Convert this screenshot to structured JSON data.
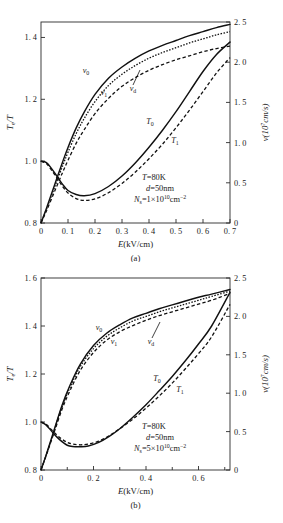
{
  "figure": {
    "panels": [
      {
        "id": "a",
        "caption": "(a)",
        "xlabel": "E(kV/cm)",
        "ylabel_left": "T",
        "ylabel_left_sub": "e",
        "ylabel_left_tail": "/T",
        "ylabel_right": "v(10",
        "ylabel_right_sup": "7",
        "ylabel_right_tail": "cm/s)",
        "annotations": [
          {
            "label": "T",
            "eq": "=80K"
          },
          {
            "label": "d",
            "eq": "=50nm"
          },
          {
            "label": "N",
            "sub": "s",
            "eq": "=1×10",
            "sup": "10",
            "tail": "cm",
            "tailsup": "−2"
          }
        ],
        "curve_labels": [
          {
            "name": "v0",
            "text": "v",
            "sub": "0"
          },
          {
            "name": "v1",
            "text": "v",
            "sub": "1"
          },
          {
            "name": "vd",
            "text": "v",
            "sub": "d"
          },
          {
            "name": "T0",
            "text": "T",
            "sub": "0"
          },
          {
            "name": "T1",
            "text": "T",
            "sub": "1"
          }
        ]
      },
      {
        "id": "b",
        "caption": "(b)",
        "xlabel": "E(kV/cm)",
        "ylabel_left": "T",
        "ylabel_left_sub": "e",
        "ylabel_left_tail": "/T",
        "ylabel_right": "v(10",
        "ylabel_right_sup": "7",
        "ylabel_right_tail": "cm/s)",
        "annotations": [
          {
            "label": "T",
            "eq": "=80K"
          },
          {
            "label": "d",
            "eq": "=50nm"
          },
          {
            "label": "N",
            "sub": "s",
            "eq": "=5×10",
            "sup": "10",
            "tail": "cm",
            "tailsup": "−2"
          }
        ],
        "curve_labels": [
          {
            "name": "v0",
            "text": "v",
            "sub": "0"
          },
          {
            "name": "v1",
            "text": "v",
            "sub": "1"
          },
          {
            "name": "vd",
            "text": "v",
            "sub": "d"
          },
          {
            "name": "T0",
            "text": "T",
            "sub": "0"
          },
          {
            "name": "T1",
            "text": "T",
            "sub": "1"
          }
        ]
      }
    ]
  },
  "chart_data": [
    {
      "type": "line",
      "panel": "a",
      "title": "",
      "xlabel": "E(kV/cm)",
      "ylabel": "Te/T",
      "ylabel_right": "v(10^7 cm/s)",
      "xlim": [
        0,
        0.7
      ],
      "ylim_left": [
        0.8,
        1.45
      ],
      "ylim_right": [
        0,
        2.5
      ],
      "xticks": [
        0,
        0.1,
        0.2,
        0.3,
        0.4,
        0.5,
        0.6,
        0.7
      ],
      "xticklabels": [
        "0",
        "0. 1",
        "0. 2",
        "0. 3",
        "0. 4",
        "0. 5",
        "0. 6",
        "0. 7"
      ],
      "yticks_left": [
        0.8,
        1.0,
        1.2,
        1.4
      ],
      "yticklabels_left": [
        "0. 8",
        "1. 0",
        "1. 2",
        "1. 4"
      ],
      "yticks_right": [
        0,
        0.5,
        1.0,
        1.5,
        2.0,
        2.5
      ],
      "yticklabels_right": [
        "0",
        "0. 5",
        "1. 0",
        "1. 5",
        "2. 0",
        "2. 5"
      ],
      "grid": false,
      "legend": "inline-labels",
      "annotation_text": [
        "T=80K",
        "d=50nm",
        "Ns=1×10^10 cm^-2"
      ],
      "series": [
        {
          "name": "v0",
          "axis": "right",
          "style": "solid",
          "x": [
            0,
            0.02,
            0.05,
            0.08,
            0.1,
            0.13,
            0.16,
            0.2,
            0.25,
            0.3,
            0.35,
            0.4,
            0.45,
            0.5,
            0.55,
            0.6,
            0.65,
            0.7
          ],
          "y": [
            0,
            0.18,
            0.47,
            0.76,
            0.94,
            1.18,
            1.38,
            1.6,
            1.8,
            1.94,
            2.05,
            2.14,
            2.21,
            2.27,
            2.33,
            2.38,
            2.43,
            2.47
          ]
        },
        {
          "name": "vd",
          "axis": "right",
          "style": "dotted",
          "x": [
            0,
            0.02,
            0.05,
            0.08,
            0.1,
            0.13,
            0.16,
            0.2,
            0.25,
            0.3,
            0.35,
            0.4,
            0.45,
            0.5,
            0.55,
            0.6,
            0.65,
            0.7
          ],
          "y": [
            0,
            0.17,
            0.44,
            0.71,
            0.88,
            1.11,
            1.3,
            1.51,
            1.71,
            1.85,
            1.96,
            2.05,
            2.12,
            2.18,
            2.24,
            2.29,
            2.34,
            2.38
          ]
        },
        {
          "name": "v1",
          "axis": "right",
          "style": "dashed",
          "x": [
            0,
            0.02,
            0.05,
            0.08,
            0.1,
            0.13,
            0.16,
            0.2,
            0.25,
            0.3,
            0.35,
            0.4,
            0.45,
            0.5,
            0.55,
            0.6,
            0.65,
            0.7
          ],
          "y": [
            0,
            0.15,
            0.39,
            0.63,
            0.78,
            0.99,
            1.16,
            1.36,
            1.55,
            1.7,
            1.81,
            1.9,
            1.97,
            2.03,
            2.08,
            2.13,
            2.17,
            2.2
          ]
        },
        {
          "name": "T0",
          "axis": "left",
          "style": "solid",
          "x": [
            0,
            0.02,
            0.04,
            0.06,
            0.08,
            0.1,
            0.13,
            0.16,
            0.2,
            0.25,
            0.3,
            0.35,
            0.4,
            0.45,
            0.5,
            0.55,
            0.6,
            0.65,
            0.7
          ],
          "y": [
            1.0,
            0.995,
            0.975,
            0.95,
            0.925,
            0.905,
            0.892,
            0.888,
            0.895,
            0.918,
            0.952,
            0.995,
            1.045,
            1.1,
            1.16,
            1.225,
            1.29,
            1.345,
            1.385
          ]
        },
        {
          "name": "T1",
          "axis": "left",
          "style": "dashed",
          "x": [
            0,
            0.02,
            0.04,
            0.06,
            0.08,
            0.1,
            0.13,
            0.16,
            0.2,
            0.25,
            0.3,
            0.35,
            0.4,
            0.45,
            0.5,
            0.55,
            0.6,
            0.65,
            0.7
          ],
          "y": [
            1.0,
            0.992,
            0.97,
            0.944,
            0.918,
            0.897,
            0.879,
            0.873,
            0.878,
            0.898,
            0.928,
            0.965,
            1.008,
            1.055,
            1.108,
            1.165,
            1.225,
            1.285,
            1.335
          ]
        }
      ]
    },
    {
      "type": "line",
      "panel": "b",
      "title": "",
      "xlabel": "E(kV/cm)",
      "ylabel": "Te/T",
      "ylabel_right": "v(10^7 cm/s)",
      "xlim": [
        0,
        0.72
      ],
      "ylim_left": [
        0.8,
        1.6
      ],
      "ylim_right": [
        0,
        2.5
      ],
      "xticks": [
        0,
        0.2,
        0.4,
        0.6
      ],
      "xticklabels": [
        "0",
        "0. 2",
        "0. 4",
        "0. 6"
      ],
      "xticks_minor": [
        0.1,
        0.3,
        0.5,
        0.7
      ],
      "yticks_left": [
        0.8,
        1.0,
        1.2,
        1.4,
        1.6
      ],
      "yticklabels_left": [
        "0. 8",
        "1. 0",
        "1. 2",
        "1. 4",
        "1. 6"
      ],
      "yticks_right": [
        0,
        0.5,
        1.0,
        1.5,
        2.0,
        2.5
      ],
      "yticklabels_right": [
        "0",
        "0. 5",
        "1. 0",
        "1. 5",
        "2. 0",
        "2. 5"
      ],
      "grid": false,
      "legend": "inline-labels",
      "annotation_text": [
        "T=80K",
        "d=50nm",
        "Ns=5×10^10 cm^-2"
      ],
      "series": [
        {
          "name": "v0",
          "axis": "right",
          "style": "solid",
          "x": [
            0,
            0.02,
            0.05,
            0.08,
            0.11,
            0.15,
            0.2,
            0.25,
            0.3,
            0.35,
            0.4,
            0.45,
            0.5,
            0.55,
            0.6,
            0.65,
            0.72
          ],
          "y": [
            0,
            0.2,
            0.52,
            0.84,
            1.1,
            1.38,
            1.62,
            1.78,
            1.89,
            1.98,
            2.04,
            2.1,
            2.15,
            2.2,
            2.25,
            2.29,
            2.35
          ]
        },
        {
          "name": "vd",
          "axis": "right",
          "style": "dotted",
          "x": [
            0,
            0.02,
            0.05,
            0.08,
            0.11,
            0.15,
            0.2,
            0.25,
            0.3,
            0.35,
            0.4,
            0.45,
            0.5,
            0.55,
            0.6,
            0.65,
            0.72
          ],
          "y": [
            0,
            0.195,
            0.51,
            0.82,
            1.07,
            1.35,
            1.58,
            1.74,
            1.85,
            1.94,
            2.0,
            2.06,
            2.11,
            2.16,
            2.21,
            2.26,
            2.33
          ]
        },
        {
          "name": "v1",
          "axis": "right",
          "style": "dashed",
          "x": [
            0,
            0.02,
            0.05,
            0.08,
            0.11,
            0.15,
            0.2,
            0.25,
            0.3,
            0.35,
            0.4,
            0.45,
            0.5,
            0.55,
            0.6,
            0.65,
            0.72
          ],
          "y": [
            0,
            0.19,
            0.49,
            0.79,
            1.03,
            1.3,
            1.53,
            1.69,
            1.8,
            1.88,
            1.95,
            2.01,
            2.06,
            2.11,
            2.16,
            2.21,
            2.3
          ]
        },
        {
          "name": "T0",
          "axis": "left",
          "style": "solid",
          "x": [
            0,
            0.02,
            0.04,
            0.06,
            0.08,
            0.1,
            0.12,
            0.15,
            0.18,
            0.22,
            0.26,
            0.3,
            0.35,
            0.4,
            0.45,
            0.5,
            0.55,
            0.6,
            0.65,
            0.72
          ],
          "y": [
            1.0,
            0.987,
            0.962,
            0.938,
            0.918,
            0.903,
            0.898,
            0.897,
            0.9,
            0.915,
            0.94,
            0.972,
            1.02,
            1.072,
            1.13,
            1.19,
            1.255,
            1.325,
            1.4,
            1.54
          ]
        },
        {
          "name": "T1",
          "axis": "left",
          "style": "dashed",
          "x": [
            0,
            0.02,
            0.04,
            0.06,
            0.08,
            0.1,
            0.12,
            0.15,
            0.18,
            0.22,
            0.26,
            0.3,
            0.35,
            0.4,
            0.45,
            0.5,
            0.55,
            0.6,
            0.65,
            0.72
          ],
          "y": [
            1.0,
            0.99,
            0.968,
            0.946,
            0.928,
            0.915,
            0.908,
            0.905,
            0.908,
            0.92,
            0.943,
            0.972,
            1.012,
            1.058,
            1.108,
            1.162,
            1.222,
            1.285,
            1.355,
            1.49
          ]
        }
      ]
    }
  ]
}
